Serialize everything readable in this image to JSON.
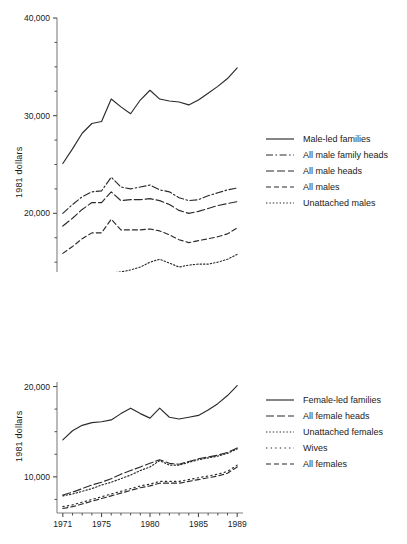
{
  "figure": {
    "charts": [
      {
        "id": "male-chart",
        "ylabel": "1981 dollars",
        "ytick_labels": [
          "40,000",
          "30,000",
          "20,000",
          "10,000"
        ],
        "xtick_labels": [
          "1971",
          "1975",
          "1980",
          "1985",
          "1989"
        ],
        "legend": [
          {
            "label": "Male-led families",
            "style": "solid"
          },
          {
            "label": "All male family heads",
            "style": "dashdot"
          },
          {
            "label": "All male heads",
            "style": "longdash"
          },
          {
            "label": "All males",
            "style": "dash"
          },
          {
            "label": "Unattached males",
            "style": "dotted"
          }
        ]
      },
      {
        "id": "female-chart",
        "ylabel": "1981 dollars",
        "ytick_labels": [
          "20,000",
          "10,000"
        ],
        "xtick_labels": [
          "1971",
          "1975",
          "1980",
          "1985",
          "1989"
        ],
        "legend": [
          {
            "label": "Female-led families",
            "style": "solid"
          },
          {
            "label": "All female heads",
            "style": "longdash"
          },
          {
            "label": "Unattached females",
            "style": "dotted"
          },
          {
            "label": "Wives",
            "style": "dotted-wide"
          },
          {
            "label": "All females",
            "style": "dash"
          }
        ]
      }
    ]
  },
  "chart_data": [
    {
      "type": "line",
      "title": "",
      "xlabel": "",
      "ylabel": "1981 dollars",
      "xlim": [
        1970.4,
        1989.6
      ],
      "ylim": [
        10000,
        40000
      ],
      "yticks": [
        10000,
        20000,
        30000,
        40000
      ],
      "ytick_labels": [
        "10,000",
        "20,000",
        "30,000",
        "40,000"
      ],
      "yminor_step": 2500,
      "xticks": [
        1971,
        1975,
        1980,
        1985,
        1989
      ],
      "xtick_labels": [
        "1971",
        "1975",
        "1980",
        "1985",
        "1989"
      ],
      "xminor_step": 1,
      "grid": false,
      "legend_position": "right",
      "x": [
        1971,
        1972,
        1973,
        1974,
        1975,
        1976,
        1977,
        1978,
        1979,
        1980,
        1981,
        1982,
        1983,
        1984,
        1985,
        1986,
        1987,
        1988,
        1989
      ],
      "series": [
        {
          "name": "Male-led families",
          "style": "solid",
          "values": [
            25100,
            26600,
            28200,
            29200,
            29400,
            31700,
            30900,
            30200,
            31600,
            32600,
            31700,
            31500,
            31400,
            31100,
            31600,
            32300,
            33000,
            33800,
            34900
          ]
        },
        {
          "name": "All male family heads",
          "style": "dashdot",
          "values": [
            20000,
            20900,
            21700,
            22200,
            22300,
            23700,
            22700,
            22500,
            22700,
            22900,
            22400,
            22200,
            21600,
            21300,
            21400,
            21800,
            22100,
            22400,
            22600
          ]
        },
        {
          "name": "All male heads",
          "style": "longdash",
          "values": [
            18700,
            19500,
            20400,
            21100,
            21100,
            22200,
            21300,
            21400,
            21400,
            21500,
            21300,
            20900,
            20300,
            20000,
            20200,
            20500,
            20800,
            21000,
            21200
          ]
        },
        {
          "name": "All males",
          "style": "dash",
          "values": [
            15900,
            16600,
            17400,
            18000,
            18000,
            19400,
            18300,
            18300,
            18300,
            18400,
            18200,
            17800,
            17300,
            17000,
            17200,
            17400,
            17600,
            17900,
            18500
          ]
        },
        {
          "name": "Unattached males",
          "style": "dotted",
          "values": [
            12100,
            12500,
            13000,
            13500,
            13300,
            13900,
            14000,
            14200,
            14500,
            15000,
            15300,
            14900,
            14500,
            14700,
            14800,
            14800,
            15000,
            15300,
            15800
          ]
        }
      ]
    },
    {
      "type": "line",
      "title": "",
      "xlabel": "",
      "ylabel": "1981 dollars",
      "xlim": [
        1970.4,
        1989.6
      ],
      "ylim": [
        6000,
        20500
      ],
      "yticks": [
        10000,
        20000
      ],
      "ytick_labels": [
        "10,000",
        "20,000"
      ],
      "yminor_step": 2500,
      "xticks": [
        1971,
        1975,
        1980,
        1985,
        1989
      ],
      "xtick_labels": [
        "1971",
        "1975",
        "1980",
        "1985",
        "1989"
      ],
      "xminor_step": 1,
      "grid": false,
      "legend_position": "right",
      "x": [
        1971,
        1972,
        1973,
        1974,
        1975,
        1976,
        1977,
        1978,
        1979,
        1980,
        1981,
        1982,
        1983,
        1984,
        1985,
        1986,
        1987,
        1988,
        1989
      ],
      "series": [
        {
          "name": "Female-led families",
          "style": "solid",
          "values": [
            14100,
            15100,
            15700,
            16000,
            16100,
            16300,
            17000,
            17600,
            17000,
            16500,
            17600,
            16600,
            16400,
            16600,
            16800,
            17400,
            18100,
            19000,
            20100
          ]
        },
        {
          "name": "All female heads",
          "style": "longdash",
          "values": [
            8000,
            8300,
            8700,
            9100,
            9400,
            9800,
            10300,
            10700,
            11100,
            11500,
            11900,
            11500,
            11400,
            11700,
            12000,
            12200,
            12400,
            12700,
            13200
          ]
        },
        {
          "name": "Unattached females",
          "style": "dotted",
          "values": [
            7900,
            8100,
            8400,
            8700,
            9100,
            9400,
            9800,
            10200,
            10700,
            11100,
            11800,
            11300,
            11300,
            11600,
            11900,
            12100,
            12300,
            12600,
            13100
          ]
        },
        {
          "name": "Wives",
          "style": "dotted-wide",
          "values": [
            6700,
            6900,
            7200,
            7500,
            7800,
            8100,
            8400,
            8700,
            9000,
            9200,
            9500,
            9500,
            9500,
            9700,
            9900,
            10100,
            10300,
            10600,
            11300
          ]
        },
        {
          "name": "All females",
          "style": "dash",
          "values": [
            6500,
            6700,
            7000,
            7300,
            7600,
            7900,
            8200,
            8500,
            8800,
            9000,
            9300,
            9300,
            9300,
            9500,
            9700,
            9900,
            10100,
            10400,
            11100
          ]
        }
      ]
    }
  ]
}
